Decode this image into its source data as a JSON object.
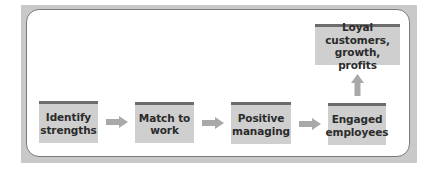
{
  "diagram": {
    "type": "flow",
    "colors": {
      "frame": "#c9c9c9",
      "panel_border": "#7a7a7a",
      "box_fill": "#cfcfcf",
      "box_top_bar": "#6c6c6c",
      "arrow": "#a9a9a9",
      "text": "#2b2b2b"
    },
    "nodes": [
      {
        "id": "identify",
        "line1": "Identify",
        "line2": "strengths"
      },
      {
        "id": "match",
        "line1": "Match to",
        "line2": "work"
      },
      {
        "id": "positive",
        "line1": "Positive",
        "line2": "managing"
      },
      {
        "id": "engaged",
        "line1": "Engaged",
        "line2": "employees"
      },
      {
        "id": "loyal",
        "line1": "Loyal customers,",
        "line2": "growth, profits"
      }
    ],
    "edges": [
      {
        "from": "identify",
        "to": "match",
        "direction": "right"
      },
      {
        "from": "match",
        "to": "positive",
        "direction": "right"
      },
      {
        "from": "positive",
        "to": "engaged",
        "direction": "right"
      },
      {
        "from": "engaged",
        "to": "loyal",
        "direction": "up"
      }
    ]
  }
}
